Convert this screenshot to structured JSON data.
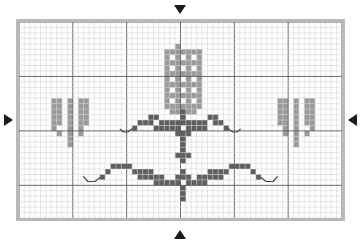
{
  "chart_data": {
    "type": "heatmap",
    "title": "",
    "subtitle": "",
    "xlabel": "",
    "ylabel": "",
    "grid": true,
    "legend_position": "none",
    "grid_columns": 60,
    "grid_rows": 36,
    "major_line_every": 10,
    "cell_size_px": 5.4,
    "xlim": [
      0,
      60
    ],
    "ylim": [
      0,
      36
    ],
    "x": [
      0,
      10,
      20,
      30,
      40,
      50,
      60
    ],
    "tick_labels_x": [
      "",
      "",
      "",
      "",
      "",
      "",
      ""
    ],
    "tick_labels_y": [
      "",
      "",
      "",
      "",
      ""
    ],
    "colors": {
      "background": "#ffffff",
      "minor_grid": "#cfcfcf",
      "major_grid": "#5a5a5a",
      "frame": "#b9b9b9",
      "light_stitch": "#9a9a9a",
      "dark_stitch": "#5f5f5f",
      "backstitch": "#4a4a4a",
      "marker": "#1b1b1b"
    },
    "symbols": [
      {
        "name": "light-stitch",
        "color": "#9a9a9a",
        "label": "light shade cross stitch"
      },
      {
        "name": "dark-stitch",
        "color": "#5f5f5f",
        "label": "dark shade cross stitch"
      },
      {
        "name": "backstitch-line",
        "color": "#4a4a4a",
        "label": "backstitch outline"
      }
    ],
    "series": [
      {
        "name": "light-stitch",
        "color": "#9a9a9a",
        "cells": [
          [
            29,
            4
          ],
          [
            27,
            5
          ],
          [
            28,
            5
          ],
          [
            29,
            5
          ],
          [
            30,
            5
          ],
          [
            31,
            5
          ],
          [
            32,
            5
          ],
          [
            33,
            5
          ],
          [
            27,
            6
          ],
          [
            29,
            6
          ],
          [
            31,
            6
          ],
          [
            33,
            6
          ],
          [
            27,
            7
          ],
          [
            28,
            7
          ],
          [
            29,
            7
          ],
          [
            30,
            7
          ],
          [
            31,
            7
          ],
          [
            32,
            7
          ],
          [
            33,
            7
          ],
          [
            27,
            8
          ],
          [
            29,
            8
          ],
          [
            31,
            8
          ],
          [
            33,
            8
          ],
          [
            27,
            9
          ],
          [
            28,
            9
          ],
          [
            29,
            9
          ],
          [
            30,
            9
          ],
          [
            31,
            9
          ],
          [
            32,
            9
          ],
          [
            33,
            9
          ],
          [
            27,
            10
          ],
          [
            29,
            10
          ],
          [
            31,
            10
          ],
          [
            33,
            10
          ],
          [
            27,
            11
          ],
          [
            28,
            11
          ],
          [
            29,
            11
          ],
          [
            30,
            11
          ],
          [
            31,
            11
          ],
          [
            32,
            11
          ],
          [
            33,
            11
          ],
          [
            27,
            12
          ],
          [
            29,
            12
          ],
          [
            31,
            12
          ],
          [
            33,
            12
          ],
          [
            27,
            13
          ],
          [
            28,
            13
          ],
          [
            29,
            13
          ],
          [
            30,
            13
          ],
          [
            31,
            13
          ],
          [
            32,
            13
          ],
          [
            33,
            13
          ],
          [
            27,
            14
          ],
          [
            29,
            14
          ],
          [
            31,
            14
          ],
          [
            33,
            14
          ],
          [
            27,
            15
          ],
          [
            28,
            15
          ],
          [
            29,
            15
          ],
          [
            30,
            15
          ],
          [
            31,
            15
          ],
          [
            32,
            15
          ],
          [
            33,
            15
          ],
          [
            28,
            16
          ],
          [
            29,
            16
          ],
          [
            30,
            16
          ],
          [
            31,
            16
          ],
          [
            32,
            16
          ],
          [
            6,
            14
          ],
          [
            7,
            14
          ],
          [
            9,
            14
          ],
          [
            11,
            14
          ],
          [
            12,
            14
          ],
          [
            6,
            15
          ],
          [
            7,
            15
          ],
          [
            9,
            15
          ],
          [
            11,
            15
          ],
          [
            12,
            15
          ],
          [
            6,
            16
          ],
          [
            7,
            16
          ],
          [
            9,
            16
          ],
          [
            11,
            16
          ],
          [
            12,
            16
          ],
          [
            6,
            17
          ],
          [
            7,
            17
          ],
          [
            9,
            17
          ],
          [
            11,
            17
          ],
          [
            12,
            17
          ],
          [
            6,
            18
          ],
          [
            7,
            18
          ],
          [
            9,
            18
          ],
          [
            11,
            18
          ],
          [
            12,
            18
          ],
          [
            6,
            19
          ],
          [
            9,
            19
          ],
          [
            11,
            19
          ],
          [
            7,
            20
          ],
          [
            9,
            20
          ],
          [
            11,
            20
          ],
          [
            9,
            21
          ],
          [
            9,
            22
          ],
          [
            48,
            14
          ],
          [
            49,
            14
          ],
          [
            51,
            14
          ],
          [
            53,
            14
          ],
          [
            54,
            14
          ],
          [
            48,
            15
          ],
          [
            49,
            15
          ],
          [
            51,
            15
          ],
          [
            53,
            15
          ],
          [
            54,
            15
          ],
          [
            48,
            16
          ],
          [
            49,
            16
          ],
          [
            51,
            16
          ],
          [
            53,
            16
          ],
          [
            54,
            16
          ],
          [
            48,
            17
          ],
          [
            49,
            17
          ],
          [
            51,
            17
          ],
          [
            53,
            17
          ],
          [
            54,
            17
          ],
          [
            48,
            18
          ],
          [
            49,
            18
          ],
          [
            51,
            18
          ],
          [
            53,
            18
          ],
          [
            54,
            18
          ],
          [
            49,
            19
          ],
          [
            51,
            19
          ],
          [
            54,
            19
          ],
          [
            49,
            20
          ],
          [
            51,
            20
          ],
          [
            53,
            20
          ],
          [
            51,
            21
          ],
          [
            51,
            22
          ]
        ]
      },
      {
        "name": "dark-stitch",
        "color": "#5f5f5f",
        "cells": [
          [
            30,
            16
          ],
          [
            30,
            17
          ],
          [
            30,
            18
          ],
          [
            24,
            17
          ],
          [
            25,
            17
          ],
          [
            35,
            17
          ],
          [
            36,
            17
          ],
          [
            22,
            18
          ],
          [
            23,
            18
          ],
          [
            24,
            18
          ],
          [
            26,
            18
          ],
          [
            27,
            18
          ],
          [
            28,
            18
          ],
          [
            29,
            18
          ],
          [
            31,
            18
          ],
          [
            32,
            18
          ],
          [
            33,
            18
          ],
          [
            34,
            18
          ],
          [
            36,
            18
          ],
          [
            37,
            18
          ],
          [
            21,
            19
          ],
          [
            25,
            19
          ],
          [
            26,
            19
          ],
          [
            27,
            19
          ],
          [
            28,
            19
          ],
          [
            29,
            19
          ],
          [
            31,
            19
          ],
          [
            32,
            19
          ],
          [
            33,
            19
          ],
          [
            34,
            19
          ],
          [
            38,
            19
          ],
          [
            29,
            20
          ],
          [
            30,
            20
          ],
          [
            31,
            20
          ],
          [
            30,
            21
          ],
          [
            30,
            22
          ],
          [
            30,
            23
          ],
          [
            29,
            24
          ],
          [
            30,
            24
          ],
          [
            31,
            24
          ],
          [
            30,
            25
          ],
          [
            17,
            26
          ],
          [
            18,
            26
          ],
          [
            19,
            26
          ],
          [
            20,
            26
          ],
          [
            39,
            26
          ],
          [
            40,
            26
          ],
          [
            41,
            26
          ],
          [
            42,
            26
          ],
          [
            16,
            27
          ],
          [
            21,
            27
          ],
          [
            22,
            27
          ],
          [
            23,
            27
          ],
          [
            24,
            27
          ],
          [
            30,
            27
          ],
          [
            35,
            27
          ],
          [
            36,
            27
          ],
          [
            37,
            27
          ],
          [
            38,
            27
          ],
          [
            43,
            27
          ],
          [
            15,
            28
          ],
          [
            22,
            28
          ],
          [
            23,
            28
          ],
          [
            24,
            28
          ],
          [
            25,
            28
          ],
          [
            26,
            28
          ],
          [
            29,
            28
          ],
          [
            30,
            28
          ],
          [
            31,
            28
          ],
          [
            33,
            28
          ],
          [
            34,
            28
          ],
          [
            35,
            28
          ],
          [
            36,
            28
          ],
          [
            37,
            28
          ],
          [
            44,
            28
          ],
          [
            25,
            29
          ],
          [
            26,
            29
          ],
          [
            27,
            29
          ],
          [
            28,
            29
          ],
          [
            29,
            29
          ],
          [
            31,
            29
          ],
          [
            32,
            29
          ],
          [
            33,
            29
          ],
          [
            34,
            29
          ],
          [
            30,
            30
          ],
          [
            30,
            31
          ],
          [
            30,
            32
          ]
        ]
      }
    ],
    "backstitch_paths": [
      {
        "name": "upper-left-tendril",
        "points": [
          [
            21.0,
            19.6
          ],
          [
            20.2,
            20.2
          ],
          [
            19.4,
            20.2
          ],
          [
            18.8,
            19.7
          ]
        ]
      },
      {
        "name": "upper-right-tendril",
        "points": [
          [
            38.9,
            19.6
          ],
          [
            39.7,
            20.2
          ],
          [
            40.5,
            20.2
          ],
          [
            41.1,
            19.7
          ]
        ]
      },
      {
        "name": "lower-left-tendril",
        "points": [
          [
            15.0,
            28.6
          ],
          [
            14.1,
            29.3
          ],
          [
            12.8,
            29.3
          ],
          [
            12.0,
            28.4
          ]
        ]
      },
      {
        "name": "lower-right-tendril",
        "points": [
          [
            45.0,
            28.6
          ],
          [
            45.9,
            29.3
          ],
          [
            47.2,
            29.3
          ],
          [
            48.0,
            28.4
          ]
        ]
      }
    ]
  },
  "markers": {
    "top": {
      "name": "center-marker-top",
      "glyph": "▼"
    },
    "bottom": {
      "name": "center-marker-bottom",
      "glyph": "▲"
    },
    "left": {
      "name": "center-marker-left",
      "glyph": "▶"
    },
    "right": {
      "name": "center-marker-right",
      "glyph": "◀"
    }
  }
}
